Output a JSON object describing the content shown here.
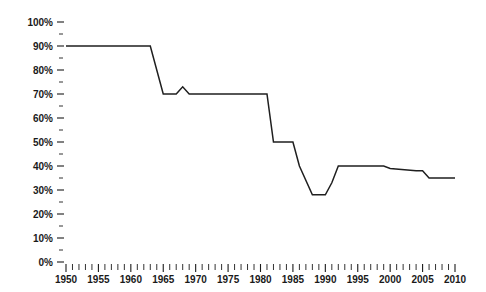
{
  "chart_data": {
    "type": "line",
    "title": "",
    "subtitle": "",
    "xlabel": "",
    "ylabel": "",
    "xlim": [
      1950,
      2010
    ],
    "ylim": [
      0,
      100
    ],
    "grid": false,
    "legend": null,
    "y_tick_labels": [
      "100%",
      "90%",
      "80%",
      "70%",
      "60%",
      "50%",
      "40%",
      "30%",
      "20%",
      "10%",
      "0%"
    ],
    "y_major_ticks": [
      100,
      90,
      80,
      70,
      60,
      50,
      40,
      30,
      20,
      10,
      0
    ],
    "y_minor_ticks": [
      95,
      85,
      75,
      65,
      55,
      45,
      35,
      25,
      15,
      5
    ],
    "x_tick_labels": [
      "1950",
      "1955",
      "1960",
      "1965",
      "1970",
      "1975",
      "1980",
      "1985",
      "1990",
      "1995",
      "2000",
      "2005",
      "2010"
    ],
    "x_major_ticks": [
      1950,
      1955,
      1960,
      1965,
      1970,
      1975,
      1980,
      1985,
      1990,
      1995,
      2000,
      2005,
      2010
    ],
    "x_minor_tick_step": 1,
    "series": [
      {
        "name": "value",
        "color": "#1f1f1f",
        "x": [
          1950,
          1963,
          1965,
          1966,
          1967,
          1968,
          1969,
          1970,
          1981,
          1982,
          1985,
          1986,
          1988,
          1990,
          1991,
          1992,
          1999,
          2000,
          2004,
          2005,
          2006,
          2010
        ],
        "values": [
          90,
          90,
          70,
          70,
          70,
          73,
          70,
          70,
          70,
          50,
          50,
          40,
          28,
          28,
          33,
          40,
          40,
          39,
          38,
          38,
          35,
          35
        ]
      }
    ]
  }
}
